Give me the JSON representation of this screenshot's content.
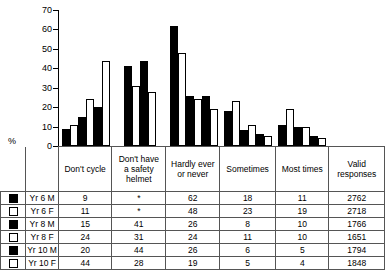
{
  "chart_data": {
    "type": "bar",
    "title": "",
    "xlabel": "",
    "ylabel": "%",
    "ylim": [
      0,
      70
    ],
    "yticks": [
      0,
      10,
      20,
      30,
      40,
      50,
      60,
      70
    ],
    "grid": false,
    "legend_position": "table-left",
    "categories": [
      "Don't cycle",
      "Don't have a safety helmet",
      "Hardly ever or never",
      "Sometimes",
      "Most times"
    ],
    "series": [
      {
        "name": "Yr 6 M",
        "fill": "black",
        "values": [
          9,
          null,
          62,
          18,
          11
        ],
        "valid_responses": 2762
      },
      {
        "name": "Yr 6 F",
        "fill": "white",
        "values": [
          11,
          null,
          48,
          23,
          19
        ],
        "valid_responses": 2718
      },
      {
        "name": "Yr 8 M",
        "fill": "black",
        "values": [
          15,
          41,
          26,
          8,
          10
        ],
        "valid_responses": 1766
      },
      {
        "name": "Yr 8 F",
        "fill": "white",
        "values": [
          24,
          31,
          24,
          11,
          10
        ],
        "valid_responses": 1651
      },
      {
        "name": "Yr 10 M",
        "fill": "black",
        "values": [
          20,
          44,
          26,
          6,
          5
        ],
        "valid_responses": 1794
      },
      {
        "name": "Yr 10 F",
        "fill": "white",
        "values": [
          44,
          28,
          19,
          5,
          4
        ],
        "valid_responses": 1848
      }
    ],
    "missing_marker": "*"
  },
  "axis": {
    "y_label": "%",
    "ticks": [
      "70",
      "60",
      "50",
      "40",
      "30",
      "20",
      "10",
      "0"
    ]
  },
  "table": {
    "category_headers": [
      {
        "lines": [
          "Don't cycle"
        ]
      },
      {
        "lines": [
          "Don't have",
          "a safety",
          "helmet"
        ]
      },
      {
        "lines": [
          "Hardly ever",
          "or never"
        ]
      },
      {
        "lines": [
          "Sometimes"
        ]
      },
      {
        "lines": [
          "Most times"
        ]
      },
      {
        "lines": [
          "Valid",
          "responses"
        ]
      }
    ],
    "rows": [
      {
        "label": "Yr 6 M",
        "fill": "m",
        "cells": [
          "9",
          "*",
          "62",
          "18",
          "11",
          "2762"
        ]
      },
      {
        "label": "Yr 6 F",
        "fill": "f",
        "cells": [
          "11",
          "*",
          "48",
          "23",
          "19",
          "2718"
        ]
      },
      {
        "label": "Yr 8 M",
        "fill": "m",
        "cells": [
          "15",
          "41",
          "26",
          "8",
          "10",
          "1766"
        ]
      },
      {
        "label": "Yr 8 F",
        "fill": "f",
        "cells": [
          "24",
          "31",
          "24",
          "11",
          "10",
          "1651"
        ]
      },
      {
        "label": "Yr 10 M",
        "fill": "m",
        "cells": [
          "20",
          "44",
          "26",
          "6",
          "5",
          "1794"
        ]
      },
      {
        "label": "Yr 10 F",
        "fill": "f",
        "cells": [
          "44",
          "28",
          "19",
          "5",
          "4",
          "1848"
        ]
      }
    ]
  },
  "colors": {
    "male_bar": "#000000",
    "female_bar": "#ffffff",
    "outline": "#000000",
    "table_border": "#555555"
  }
}
